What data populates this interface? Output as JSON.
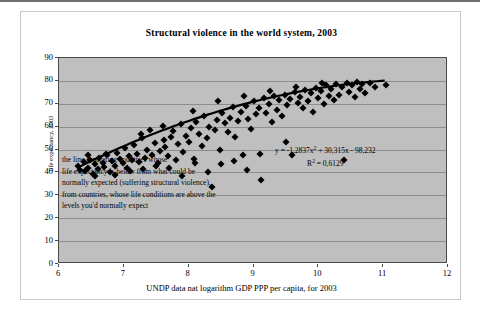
{
  "chart_data": {
    "type": "scatter",
    "title": "Structural violence in the world system, 2003",
    "xlabel": "UNDP data nat logarithm GDP PPP per capita, for 2003",
    "ylabel": "life expectancy, 2003",
    "xlim": [
      6,
      12
    ],
    "ylim": [
      0,
      90
    ],
    "xticks": [
      "6",
      "7",
      "8",
      "9",
      "10",
      "11",
      "12"
    ],
    "yticks": [
      "0",
      "10",
      "20",
      "30",
      "40",
      "50",
      "60",
      "70",
      "80",
      "90"
    ],
    "grid": true,
    "legend": "none",
    "plot_background": "#bfbfbf",
    "point_color": "#000000",
    "trendline_color": "#000000",
    "trendline": {
      "type": "polynomial-order-2",
      "equation": "y = -1,2837x² + 30,315x - 98,232",
      "r_squared": "R² = 0,6129",
      "a": -1.2837,
      "b": 30.315,
      "c": -98.232,
      "x_start": 6.3,
      "x_end": 11.05
    },
    "annotation": {
      "lines": [
        "the line separating countries whose",
        "life expectancy is below from what could be",
        "normally expected (suffering structural violence),",
        "from countries, whose life conditions are above the",
        "levels you'd normally expect"
      ]
    },
    "points": [
      [
        6.3,
        43.0
      ],
      [
        6.33,
        41.0
      ],
      [
        6.38,
        44.5
      ],
      [
        6.4,
        40.5
      ],
      [
        6.45,
        42.0
      ],
      [
        6.48,
        45.5
      ],
      [
        6.52,
        39.5
      ],
      [
        6.55,
        43.5
      ],
      [
        6.6,
        41.5
      ],
      [
        6.62,
        46.5
      ],
      [
        6.68,
        44.0
      ],
      [
        6.7,
        42.5
      ],
      [
        6.74,
        47.5
      ],
      [
        6.78,
        40.0
      ],
      [
        6.82,
        45.0
      ],
      [
        6.86,
        43.0
      ],
      [
        6.9,
        48.5
      ],
      [
        6.94,
        46.0
      ],
      [
        6.98,
        44.0
      ],
      [
        7.02,
        50.5
      ],
      [
        7.05,
        42.0
      ],
      [
        7.08,
        47.0
      ],
      [
        7.12,
        45.5
      ],
      [
        7.16,
        52.0
      ],
      [
        7.2,
        48.0
      ],
      [
        7.24,
        44.5
      ],
      [
        7.28,
        55.0
      ],
      [
        7.32,
        46.5
      ],
      [
        7.36,
        50.0
      ],
      [
        7.4,
        58.5
      ],
      [
        7.44,
        47.5
      ],
      [
        7.48,
        53.0
      ],
      [
        7.52,
        44.0
      ],
      [
        7.56,
        49.5
      ],
      [
        7.6,
        60.5
      ],
      [
        7.64,
        51.0
      ],
      [
        7.68,
        47.0
      ],
      [
        7.72,
        55.5
      ],
      [
        7.76,
        58.0
      ],
      [
        7.8,
        45.5
      ],
      [
        7.84,
        52.5
      ],
      [
        7.88,
        61.0
      ],
      [
        7.92,
        49.0
      ],
      [
        7.96,
        56.0
      ],
      [
        8.0,
        53.5
      ],
      [
        8.04,
        59.5
      ],
      [
        8.08,
        46.0
      ],
      [
        8.12,
        62.0
      ],
      [
        8.16,
        57.0
      ],
      [
        8.2,
        51.5
      ],
      [
        8.24,
        64.5
      ],
      [
        8.28,
        55.0
      ],
      [
        8.32,
        60.0
      ],
      [
        8.36,
        33.5
      ],
      [
        8.4,
        58.5
      ],
      [
        8.44,
        63.0
      ],
      [
        8.48,
        50.0
      ],
      [
        8.52,
        66.0
      ],
      [
        8.56,
        61.5
      ],
      [
        8.6,
        57.5
      ],
      [
        8.64,
        64.0
      ],
      [
        8.68,
        68.5
      ],
      [
        8.72,
        55.5
      ],
      [
        8.76,
        62.5
      ],
      [
        8.8,
        66.5
      ],
      [
        8.84,
        47.5
      ],
      [
        8.88,
        69.0
      ],
      [
        8.92,
        63.5
      ],
      [
        8.96,
        59.0
      ],
      [
        9.0,
        71.0
      ],
      [
        9.04,
        65.5
      ],
      [
        9.08,
        68.0
      ],
      [
        9.12,
        36.5
      ],
      [
        9.16,
        72.5
      ],
      [
        9.2,
        66.0
      ],
      [
        9.24,
        70.0
      ],
      [
        9.28,
        62.0
      ],
      [
        9.32,
        73.5
      ],
      [
        9.36,
        67.5
      ],
      [
        9.4,
        71.5
      ],
      [
        9.44,
        64.5
      ],
      [
        9.48,
        74.0
      ],
      [
        9.52,
        69.5
      ],
      [
        9.56,
        72.0
      ],
      [
        9.6,
        47.5
      ],
      [
        9.64,
        75.0
      ],
      [
        9.68,
        70.5
      ],
      [
        9.72,
        73.0
      ],
      [
        9.76,
        68.0
      ],
      [
        9.8,
        76.0
      ],
      [
        9.84,
        71.0
      ],
      [
        9.88,
        74.5
      ],
      [
        9.92,
        66.5
      ],
      [
        9.96,
        77.0
      ],
      [
        10.0,
        72.5
      ],
      [
        10.04,
        75.5
      ],
      [
        10.08,
        70.0
      ],
      [
        10.12,
        78.0
      ],
      [
        10.16,
        73.5
      ],
      [
        10.2,
        76.5
      ],
      [
        10.24,
        71.5
      ],
      [
        10.28,
        78.5
      ],
      [
        10.32,
        74.0
      ],
      [
        10.36,
        77.5
      ],
      [
        10.4,
        45.5
      ],
      [
        10.44,
        79.0
      ],
      [
        10.48,
        75.0
      ],
      [
        10.52,
        78.0
      ],
      [
        10.56,
        73.0
      ],
      [
        10.6,
        79.5
      ],
      [
        10.64,
        76.5
      ],
      [
        10.68,
        78.5
      ],
      [
        10.72,
        74.5
      ],
      [
        10.8,
        79.0
      ],
      [
        10.88,
        77.5
      ],
      [
        11.05,
        78.0
      ],
      [
        6.72,
        48.0
      ],
      [
        7.1,
        40.5
      ],
      [
        7.3,
        41.5
      ],
      [
        7.5,
        43.0
      ],
      [
        7.7,
        42.0
      ],
      [
        7.9,
        38.5
      ],
      [
        8.1,
        44.0
      ],
      [
        8.3,
        40.0
      ],
      [
        8.5,
        43.5
      ],
      [
        8.7,
        45.0
      ],
      [
        8.9,
        41.0
      ],
      [
        9.5,
        53.5
      ],
      [
        9.1,
        48.0
      ],
      [
        6.44,
        47.5
      ],
      [
        6.56,
        38.5
      ],
      [
        6.86,
        39.0
      ],
      [
        7.26,
        57.0
      ],
      [
        7.62,
        54.0
      ],
      [
        8.06,
        67.0
      ],
      [
        8.46,
        71.0
      ],
      [
        8.86,
        73.5
      ],
      [
        9.26,
        75.5
      ],
      [
        9.66,
        77.5
      ],
      [
        10.06,
        79.0
      ]
    ]
  }
}
